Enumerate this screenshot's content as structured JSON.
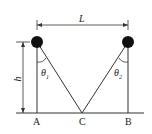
{
  "diagram": {
    "labels": {
      "L": "L",
      "h": "h",
      "theta_left": "θ",
      "theta_left_sub": "1",
      "theta_right": "θ",
      "theta_right_sub": "2",
      "A": "A",
      "C": "C",
      "B": "B"
    },
    "colors": {
      "line": "#333333",
      "ball": "#111111"
    }
  }
}
